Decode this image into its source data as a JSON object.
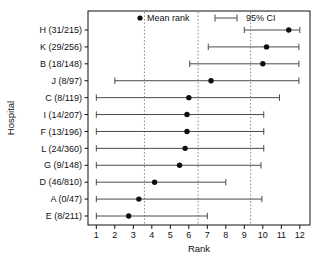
{
  "chart_data": {
    "type": "scatter",
    "title": "",
    "xlabel": "Rank",
    "ylabel": "Hospital",
    "xlim": [
      0.55,
      12.55
    ],
    "xticks": [
      1,
      2,
      3,
      4,
      5,
      6,
      7,
      8,
      9,
      10,
      11,
      12
    ],
    "xticklabels": [
      "1",
      "2",
      "3",
      "4",
      "5",
      "6",
      "7",
      "8",
      "9",
      "10",
      "11",
      "12"
    ],
    "grid": false,
    "legend": [
      {
        "label": "Mean rank",
        "marker": "dot",
        "color": "#0f0f0f"
      },
      {
        "label": "95% CI",
        "marker": "errorbar",
        "color": "#4a4a4a"
      }
    ],
    "legend_position": "top-inside",
    "reference_lines": [
      3.6,
      6.5,
      9.34
    ],
    "categories": [
      "H (31/215)",
      "K (29/256)",
      "B (18/148)",
      "J (8/97)",
      "C (8/119)",
      "I (14/207)",
      "F (13/196)",
      "L (24/360)",
      "G (9/148)",
      "D (46/810)",
      "A (0/47)",
      "E (8/211)"
    ],
    "series": [
      {
        "name": "Mean rank",
        "values": [
          11.4,
          10.2,
          10.0,
          7.2,
          6.0,
          5.9,
          5.9,
          5.8,
          5.5,
          4.15,
          3.3,
          2.75
        ],
        "ci_low": [
          9.0,
          7.05,
          6.05,
          2.0,
          1.0,
          1.0,
          1.0,
          1.0,
          1.0,
          1.0,
          1.0,
          1.0
        ],
        "ci_high": [
          12.0,
          11.95,
          11.95,
          11.95,
          10.9,
          10.05,
          10.05,
          10.05,
          9.9,
          8.0,
          9.95,
          7.0
        ]
      }
    ]
  },
  "axes": {
    "x_title": "Rank",
    "y_title": "Hospital"
  },
  "legend": {
    "mean_label": "Mean rank",
    "ci_label": "95% CI"
  }
}
